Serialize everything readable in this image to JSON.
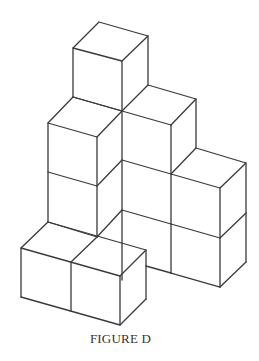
{
  "figure": {
    "caption": "FIGURE D",
    "stroke_color": "#3a3a3a",
    "background": "#ffffff",
    "cube_count_visible": 9
  }
}
